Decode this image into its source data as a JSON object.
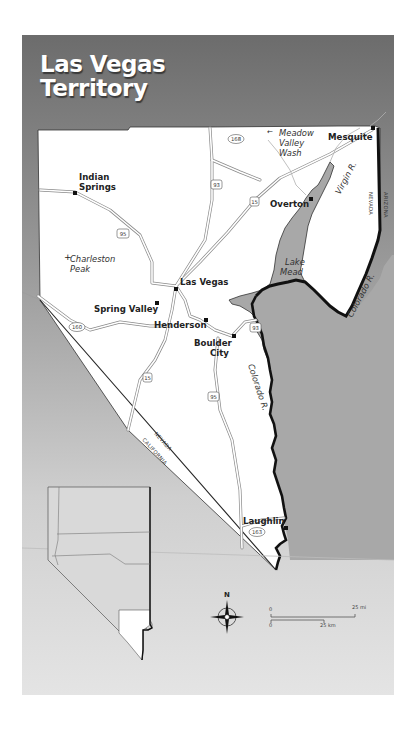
{
  "title": {
    "line1": "Las Vegas",
    "line2": "Territory"
  },
  "cities": [
    {
      "name": "Indian Springs",
      "lines": [
        "Indian",
        "Springs"
      ]
    },
    {
      "name": "Las Vegas"
    },
    {
      "name": "Spring Valley"
    },
    {
      "name": "Henderson"
    },
    {
      "name": "Boulder City",
      "lines": [
        "Boulder",
        "City"
      ]
    },
    {
      "name": "Overton"
    },
    {
      "name": "Mesquite"
    },
    {
      "name": "Laughlin"
    }
  ],
  "features": {
    "peak": [
      "Charleston",
      "Peak"
    ],
    "wash": [
      "Meadow",
      "Valley",
      "Wash"
    ],
    "lake": [
      "Lake",
      "Mead"
    ],
    "virgin_river": "Virgin R.",
    "colorado_river_upper": "Colorado R.",
    "colorado_river_lower": "Colorado R."
  },
  "states": {
    "nevada_east": "NEVADA",
    "arizona": "ARIZONA",
    "nevada_south": "NEVADA",
    "california": "CALIFORNIA"
  },
  "highways": {
    "us95_north": "95",
    "us95_south": "95",
    "us93_north": "93",
    "us93_south": "93",
    "i15_north": "15",
    "i15_south": "15",
    "nv168": "168",
    "nv160": "160",
    "nv163": "163"
  },
  "compass": {
    "north_label": "N"
  },
  "scale_bar": {
    "mi_start": "0",
    "mi_end": "25 mi",
    "km_start": "0",
    "km_end": "25 km"
  },
  "colors": {
    "frame_top": "#6e6e6e",
    "frame_bottom": "#e2e2e2",
    "land": "#ffffff",
    "water": "#a9a9a9",
    "border": "#111111"
  }
}
